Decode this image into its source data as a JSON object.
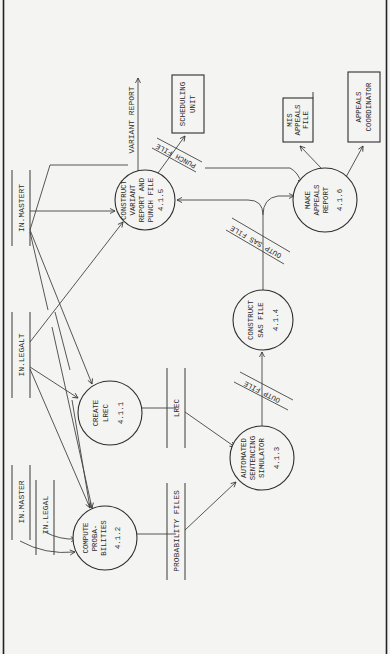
{
  "diagram": {
    "type": "data flow diagram (rotated 90°)",
    "processes": [
      {
        "id": "4.1.1",
        "lines": [
          "CREATE",
          "LREC"
        ],
        "number": "4.1.1"
      },
      {
        "id": "4.1.2",
        "lines": [
          "COMPUTE",
          "PROBA-",
          "BILITIES"
        ],
        "number": "4.1.2"
      },
      {
        "id": "4.1.3",
        "lines": [
          "AUTOMATED",
          "SENTENCING",
          "SIMULATOR"
        ],
        "number": "4.1.3"
      },
      {
        "id": "4.1.4",
        "lines": [
          "CONSTRUCT",
          "SAS FILE"
        ],
        "number": "4.1.4"
      },
      {
        "id": "4.1.5",
        "lines": [
          "CONSTRUCT",
          "VARIANT",
          "REPORT AND",
          "PUNCH FILE"
        ],
        "number": "4.1.5"
      },
      {
        "id": "4.1.6",
        "lines": [
          "MAKE",
          "APPEALS",
          "REPORT"
        ],
        "number": "4.1.6"
      }
    ],
    "data_stores": {
      "in_mastert": "IN.MASTERT",
      "in_legalt": "IN.LEGALT",
      "in_master": "IN.MASTER",
      "in_legal": "IN.LEGAL",
      "lrec": "LREC",
      "probability_files": "PROBABILITY FILES"
    },
    "flows": {
      "outp_file": "OUTP FILE",
      "outp_sas_file": "OUTP SAS FILE",
      "punch_file": "PUNCH FILE",
      "variant_report": "VARIANT REPORT"
    },
    "external_entities": {
      "scheduling_unit": [
        "SCHEDULING",
        "UNIT"
      ],
      "mis_appeals_file": [
        "MIS",
        "APPEALS",
        "FILE"
      ],
      "appeals_coordinator": [
        "APPEALS",
        "COORDINATOR"
      ]
    }
  }
}
